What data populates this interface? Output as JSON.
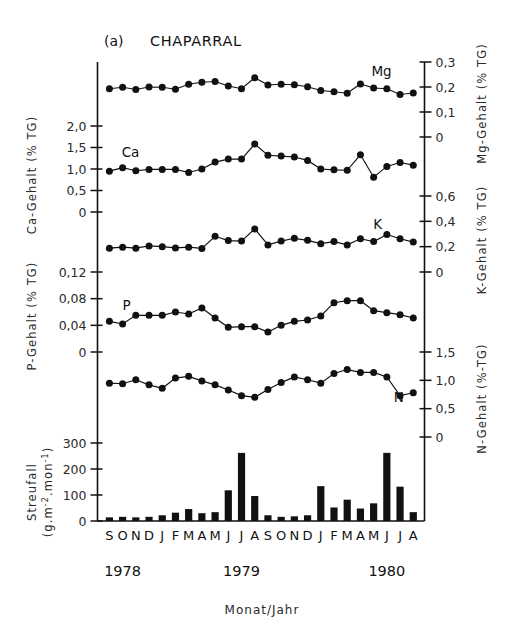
{
  "figure": {
    "panel_label": "(a)",
    "title": "CHAPARRAL",
    "xlabel": "Monat/Jahr",
    "months": [
      "S",
      "O",
      "N",
      "D",
      "J",
      "F",
      "M",
      "A",
      "M",
      "J",
      "J",
      "A",
      "S",
      "O",
      "N",
      "D",
      "J",
      "F",
      "M",
      "A",
      "M",
      "J",
      "J",
      "A"
    ],
    "years": [
      {
        "label": "1978",
        "month_index": 1
      },
      {
        "label": "1979",
        "month_index": 10
      },
      {
        "label": "1980",
        "month_index": 21
      }
    ]
  },
  "axes": {
    "ca": {
      "title": "Ca-Gehalt (% TG)",
      "ticks": [
        "2,0",
        "1,5",
        "1,0",
        "0,5",
        "0"
      ],
      "tick_values": [
        2.0,
        1.5,
        1.0,
        0.5,
        0
      ],
      "min": 0,
      "max": 2.0,
      "side": "left"
    },
    "p": {
      "title": "P-Gehalt (% TG)",
      "ticks": [
        "0,12",
        "0,08",
        "0,04",
        "0"
      ],
      "tick_values": [
        0.12,
        0.08,
        0.04,
        0
      ],
      "min": 0,
      "max": 0.12,
      "side": "left"
    },
    "streufall": {
      "title": "Streufall (g.m-2.mon-1)",
      "title_line1": "Streufall",
      "title_line2": "(g.m  .mon  )",
      "ticks": [
        "300",
        "200",
        "100",
        "0"
      ],
      "tick_values": [
        300,
        200,
        100,
        0
      ],
      "min": 0,
      "max": 300,
      "side": "left"
    },
    "mg": {
      "title": "Mg-Gehalt (% TG)",
      "ticks": [
        "0,3",
        "0,2",
        "0,1",
        "0"
      ],
      "tick_values": [
        0.3,
        0.2,
        0.1,
        0
      ],
      "min": 0,
      "max": 0.3,
      "side": "right"
    },
    "k": {
      "title": "K-Gehalt (% TG)",
      "ticks": [
        "0,6",
        "0,4",
        "0,2",
        "0"
      ],
      "tick_values": [
        0.6,
        0.4,
        0.2,
        0
      ],
      "min": 0,
      "max": 0.6,
      "side": "right"
    },
    "n": {
      "title": "N-Gehalt (%-TG)",
      "ticks": [
        "1,5",
        "1,0",
        "0,5",
        "0"
      ],
      "tick_values": [
        1.5,
        1.0,
        0.5,
        0
      ],
      "min": 0,
      "max": 1.5,
      "side": "right"
    }
  },
  "chart_data": {
    "type": "line",
    "xlabel": "Monat/Jahr",
    "grid": false,
    "legend": "inline series labels",
    "x": [
      "S 1978",
      "O 1978",
      "N 1978",
      "D 1978",
      "J 1979",
      "F 1979",
      "M 1979",
      "A 1979",
      "M 1979",
      "J 1979",
      "J 1979",
      "A 1979",
      "S 1979",
      "O 1979",
      "N 1979",
      "D 1979",
      "J 1980",
      "F 1980",
      "M 1980",
      "A 1980",
      "M 1980",
      "J 1980",
      "J 1980",
      "A 1980"
    ],
    "series": [
      {
        "name": "Mg",
        "label": "Mg",
        "axis": "mg",
        "unit": "% TG",
        "ylim": [
          0,
          0.3
        ],
        "values": [
          0.193,
          0.199,
          0.19,
          0.2,
          0.199,
          0.191,
          0.211,
          0.219,
          0.222,
          0.204,
          0.193,
          0.237,
          0.208,
          0.211,
          0.209,
          0.201,
          0.186,
          0.181,
          0.175,
          0.212,
          0.196,
          0.193,
          0.17,
          0.176
        ]
      },
      {
        "name": "Ca",
        "label": "Ca",
        "axis": "ca",
        "unit": "% TG",
        "ylim": [
          0,
          2.0
        ],
        "values": [
          0.95,
          1.03,
          0.96,
          0.99,
          0.99,
          0.99,
          0.92,
          1.0,
          1.16,
          1.23,
          1.23,
          1.58,
          1.32,
          1.3,
          1.28,
          1.2,
          1.0,
          0.98,
          0.97,
          1.33,
          0.81,
          1.06,
          1.15,
          1.09
        ]
      },
      {
        "name": "K",
        "label": "K",
        "axis": "k",
        "unit": "% TG",
        "ylim": [
          0,
          0.6
        ],
        "values": [
          0.188,
          0.196,
          0.188,
          0.206,
          0.2,
          0.19,
          0.196,
          0.186,
          0.282,
          0.248,
          0.244,
          0.34,
          0.214,
          0.244,
          0.266,
          0.25,
          0.224,
          0.24,
          0.214,
          0.262,
          0.24,
          0.296,
          0.262,
          0.236
        ]
      },
      {
        "name": "P",
        "label": "P",
        "axis": "p",
        "unit": "% TG",
        "ylim": [
          0,
          0.12
        ],
        "values": [
          0.046,
          0.042,
          0.055,
          0.055,
          0.055,
          0.06,
          0.057,
          0.066,
          0.051,
          0.037,
          0.038,
          0.038,
          0.03,
          0.04,
          0.046,
          0.048,
          0.054,
          0.074,
          0.077,
          0.077,
          0.062,
          0.059,
          0.056,
          0.051
        ]
      },
      {
        "name": "N",
        "label": "N",
        "axis": "n",
        "unit": "%-TG",
        "ylim": [
          0,
          1.5
        ],
        "values": [
          0.95,
          0.94,
          1.01,
          0.92,
          0.86,
          1.04,
          1.07,
          0.99,
          0.92,
          0.83,
          0.73,
          0.7,
          0.84,
          0.96,
          1.06,
          1.01,
          0.95,
          1.12,
          1.19,
          1.14,
          1.14,
          1.06,
          0.73,
          0.78
        ]
      }
    ],
    "bars": {
      "name": "Streufall",
      "axis": "streufall",
      "unit": "g.m-2.mon-1",
      "ylim": [
        0,
        300
      ],
      "values": [
        14,
        16,
        14,
        16,
        22,
        32,
        46,
        30,
        34,
        118,
        262,
        96,
        22,
        16,
        18,
        22,
        134,
        52,
        82,
        48,
        68,
        262,
        132,
        34
      ]
    }
  }
}
